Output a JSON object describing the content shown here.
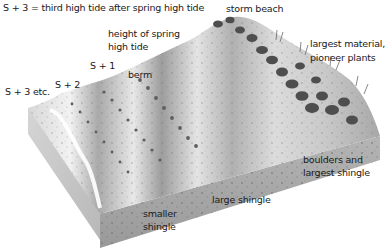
{
  "diagram": {
    "type": "cross-section illustration",
    "labels": {
      "legend": "S + 3 = third high tide after spring high tide",
      "storm_beach": "storm beach",
      "height_spring_line1": "height of spring",
      "height_spring_line2": "high tide",
      "largest_material_line1": "largest material,",
      "largest_material_line2": "pioneer plants",
      "s1": "S + 1",
      "berm": "berm",
      "s2": "S + 2",
      "s3": "S + 3 etc.",
      "boulders_line1": "boulders and",
      "boulders_line2": "largest shingle",
      "large_shingle": "large shingle",
      "smaller_line1": "smaller",
      "smaller_line2": "shingle"
    },
    "colors": {
      "background": "#ffffff",
      "sand_light": "#e6e6e6",
      "sand_mid": "#bdbdbd",
      "sand_dark": "#8a8a8a",
      "pebble": "#5a5a5a",
      "text": "#1a1a1a"
    }
  }
}
